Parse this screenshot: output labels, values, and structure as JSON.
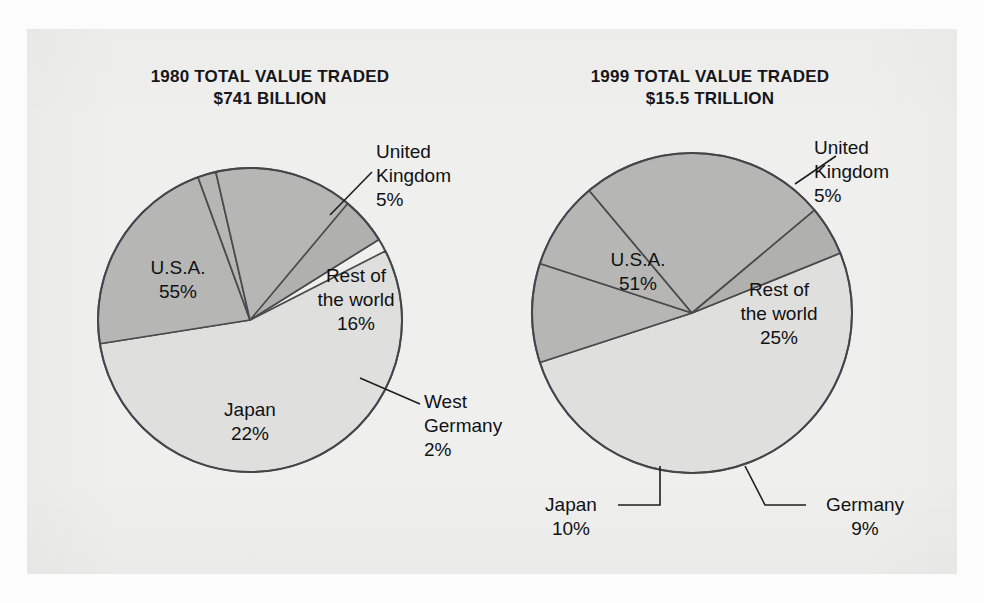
{
  "figure": {
    "background_color": "#eff0ee",
    "page_color": "#ffffff"
  },
  "charts": [
    {
      "id": "chart-1980",
      "title_line1": "1980 TOTAL VALUE TRADED",
      "title_line2": "$741 BILLION",
      "year": "1980",
      "total_value": "$741 BILLION",
      "center": {
        "x": 250,
        "y": 320
      },
      "radius": 152,
      "slices": [
        {
          "name": "U.S.A.",
          "label": "U.S.A.",
          "percent": 55,
          "pct_text": "55%",
          "color": "#dfe0de",
          "start_deg": 63,
          "end_deg": 261
        },
        {
          "name": "Japan",
          "label": "Japan",
          "percent": 22,
          "pct_text": "22%",
          "color": "#b6b7b4",
          "start_deg": 261,
          "end_deg": 340
        },
        {
          "name": "West Germany",
          "label": "West Germany",
          "percent": 2,
          "pct_text": "2%",
          "color": "#b6b7b4",
          "start_deg": 340,
          "end_deg": 347
        },
        {
          "name": "Rest of the world",
          "label": "Rest of the world",
          "percent": 16,
          "pct_text": "16%",
          "color": "#b6b7b4",
          "start_deg": 347,
          "end_deg": 58
        },
        {
          "name": "United Kingdom",
          "label": "United Kingdom",
          "percent": 5,
          "pct_text": "5%",
          "color": "#b0b1ae",
          "start_deg": 40,
          "end_deg": 58
        }
      ]
    },
    {
      "id": "chart-1999",
      "title_line1": "1999 TOTAL VALUE TRADED",
      "title_line2": "$15.5 TRILLION",
      "year": "1999",
      "total_value": "$15.5 TRILLION",
      "center": {
        "x": 692,
        "y": 313
      },
      "radius": 160,
      "slices": [
        {
          "name": "U.S.A.",
          "label": "U.S.A.",
          "percent": 51,
          "pct_text": "51%",
          "color": "#dfe0de",
          "start_deg": 68,
          "end_deg": 252
        },
        {
          "name": "Japan",
          "label": "Japan",
          "percent": 10,
          "pct_text": "10%",
          "color": "#b6b7b4",
          "start_deg": 252,
          "end_deg": 288
        },
        {
          "name": "Germany",
          "label": "Germany",
          "percent": 9,
          "pct_text": "9%",
          "color": "#b6b7b4",
          "start_deg": 288,
          "end_deg": 320
        },
        {
          "name": "Rest of the world",
          "label": "Rest of the world",
          "percent": 25,
          "pct_text": "25%",
          "color": "#b6b7b4",
          "start_deg": 320,
          "end_deg": 50
        },
        {
          "name": "United Kingdom",
          "label": "United Kingdom",
          "percent": 5,
          "pct_text": "5%",
          "color": "#b0b1ae",
          "start_deg": 50,
          "end_deg": 68
        }
      ]
    }
  ],
  "labels": {
    "c1_usa": {
      "line1": "U.S.A.",
      "line2": "",
      "pct": "55%"
    },
    "c1_row": {
      "line1": "Rest of",
      "line2": "the world",
      "pct": "16%"
    },
    "c1_japan": {
      "line1": "Japan",
      "line2": "",
      "pct": "22%"
    },
    "c1_uk": {
      "line1": "United",
      "line2": "Kingdom",
      "pct": "5%"
    },
    "c1_germany": {
      "line1": "West",
      "line2": "Germany",
      "pct": "2%"
    },
    "c2_usa": {
      "line1": "U.S.A.",
      "line2": "",
      "pct": "51%"
    },
    "c2_row": {
      "line1": "Rest of",
      "line2": "the world",
      "pct": "25%"
    },
    "c2_japan": {
      "line1": "Japan",
      "line2": "",
      "pct": "10%"
    },
    "c2_uk": {
      "line1": "United",
      "line2": "Kingdom",
      "pct": "5%"
    },
    "c2_germany": {
      "line1": "Germany",
      "line2": "",
      "pct": "9%"
    }
  },
  "chart_data": [
    {
      "type": "pie",
      "title": "1980 TOTAL VALUE TRADED $741 BILLION",
      "subtitle": "$741 BILLION",
      "year": 1980,
      "total_value_label": "$741 BILLION",
      "unit": "percent of total value traded",
      "categories": [
        "U.S.A.",
        "Japan",
        "Rest of the world",
        "United Kingdom",
        "West Germany"
      ],
      "values": [
        55,
        22,
        16,
        5,
        2
      ],
      "colors": [
        "#dfe0de",
        "#b6b7b4",
        "#b6b7b4",
        "#b0b1ae",
        "#b6b7b4"
      ],
      "legend": "none",
      "data_labels": [
        "55%",
        "22%",
        "16%",
        "5%",
        "2%"
      ]
    },
    {
      "type": "pie",
      "title": "1999 TOTAL VALUE TRADED $15.5 TRILLION",
      "subtitle": "$15.5 TRILLION",
      "year": 1999,
      "total_value_label": "$15.5 TRILLION",
      "unit": "percent of total value traded",
      "categories": [
        "U.S.A.",
        "Rest of the world",
        "Japan",
        "Germany",
        "United Kingdom"
      ],
      "values": [
        51,
        25,
        10,
        9,
        5
      ],
      "colors": [
        "#dfe0de",
        "#b6b7b4",
        "#b6b7b4",
        "#b6b7b4",
        "#b0b1ae"
      ],
      "legend": "none",
      "data_labels": [
        "51%",
        "25%",
        "10%",
        "9%",
        "5%"
      ]
    }
  ]
}
